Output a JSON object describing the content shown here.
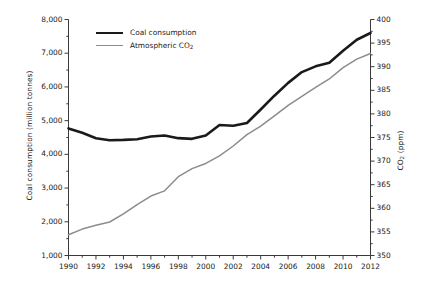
{
  "chart_data": {
    "type": "line",
    "title": "",
    "xlabel": "",
    "ylabel": "Coal consumption (million tonnes)",
    "ylabel_right": "CO2 (ppm)",
    "ylabel_right_parts": {
      "prefix": "CO",
      "sub": "2",
      "suffix": " (ppm)"
    },
    "x": [
      1990,
      1991,
      1992,
      1993,
      1994,
      1995,
      1996,
      1997,
      1998,
      1999,
      2000,
      2001,
      2002,
      2003,
      2004,
      2005,
      2006,
      2007,
      2008,
      2009,
      2010,
      2011,
      2012
    ],
    "xlim": [
      1990,
      2012
    ],
    "xticks": [
      1990,
      1992,
      1994,
      1996,
      1998,
      2000,
      2002,
      2004,
      2006,
      2008,
      2010,
      2012
    ],
    "xtick_labels": [
      "1990",
      "1992",
      "1994",
      "1996",
      "1998",
      "2000",
      "2002",
      "2004",
      "2006",
      "2008",
      "2010",
      "2012"
    ],
    "xminor_step": 1,
    "grid": false,
    "legend_position": "top-left",
    "series": [
      {
        "name": "Coal consumption",
        "axis": "left",
        "color": "#1a1a1a",
        "width": 2.6,
        "unit": "million tonnes",
        "values": [
          4770,
          4640,
          4480,
          4420,
          4430,
          4450,
          4530,
          4560,
          4480,
          4460,
          4560,
          4870,
          4850,
          4930,
          5330,
          5740,
          6120,
          6440,
          6610,
          6720,
          7070,
          7400,
          7600
        ]
      },
      {
        "name": "Atmospheric CO2",
        "name_parts": {
          "prefix": "Atmospheric CO",
          "sub": "2",
          "suffix": ""
        },
        "axis": "right",
        "color": "#8c8c8c",
        "width": 1.5,
        "unit": "ppm",
        "values": [
          354.4,
          355.6,
          356.4,
          357.1,
          358.8,
          360.8,
          362.6,
          363.7,
          366.7,
          368.4,
          369.5,
          371.1,
          373.2,
          375.6,
          377.4,
          379.6,
          381.8,
          383.7,
          385.6,
          387.4,
          389.8,
          391.6,
          392.8
        ]
      }
    ],
    "axes": {
      "left": {
        "label": "Coal consumption (million tonnes)",
        "lim": [
          1000,
          8000
        ],
        "ticks": [
          1000,
          2000,
          3000,
          4000,
          5000,
          6000,
          7000,
          8000
        ],
        "tick_labels": [
          "1,000",
          "2,000",
          "3,000",
          "4,000",
          "5,000",
          "6,000",
          "7,000",
          "8,000"
        ],
        "minor_step": 500
      },
      "right": {
        "label": "CO2 (ppm)",
        "lim": [
          350,
          400
        ],
        "ticks": [
          350,
          355,
          360,
          365,
          370,
          375,
          380,
          385,
          390,
          395,
          400
        ],
        "tick_labels": [
          "350",
          "355",
          "360",
          "365",
          "370",
          "375",
          "380",
          "385",
          "390",
          "395",
          "400"
        ],
        "minor_step": 2.5
      }
    }
  },
  "legend": {
    "items": [
      {
        "label": "Coal consumption",
        "sub": "",
        "tail": ""
      },
      {
        "label": "Atmospheric CO",
        "sub": "2",
        "tail": ""
      }
    ]
  }
}
